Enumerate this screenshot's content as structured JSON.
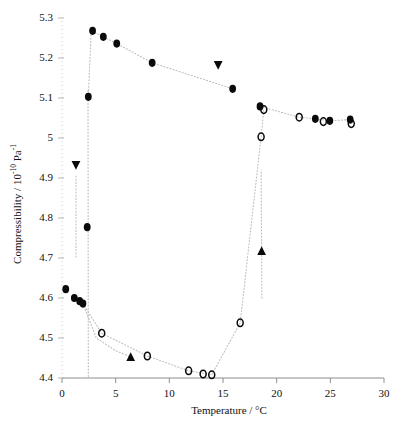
{
  "chart_data": {
    "type": "scatter",
    "title": "",
    "xlabel": "Temperature / °C",
    "ylabel": "Compressibility / 10⁻¹⁰ Pa⁻¹",
    "ylabel_parts": {
      "main": "Compressibility / 10",
      "exp1": "-10",
      "mid": " Pa",
      "exp2": "-1"
    },
    "xlim": [
      0,
      30
    ],
    "ylim": [
      4.4,
      5.3
    ],
    "xticks": [
      0,
      5,
      10,
      15,
      20,
      25,
      30
    ],
    "xtick_labels": [
      "0",
      "5",
      "10",
      "15",
      "20",
      "25",
      "30"
    ],
    "yticks": [
      4.4,
      4.5,
      4.6,
      4.7,
      4.8,
      4.9,
      5.0,
      5.1,
      5.2,
      5.3
    ],
    "ytick_labels": [
      "4.4",
      "4.5",
      "4.6",
      "4.7",
      "4.8",
      "4.9",
      "5",
      "5.1",
      "5.2",
      "5.3"
    ],
    "grid": false,
    "legend": "none",
    "marker_colors": {
      "filled": "#0a0a0a",
      "open": "#0a0a0a",
      "line": "#b9b9b9"
    },
    "series": [
      {
        "name": "filled-circles-branch",
        "marker": "filled-circle",
        "points": [
          {
            "x": 0.35,
            "y": 4.622
          },
          {
            "x": 1.15,
            "y": 4.6
          },
          {
            "x": 1.65,
            "y": 4.592
          },
          {
            "x": 1.95,
            "y": 4.586
          },
          {
            "x": 2.35,
            "y": 4.777
          },
          {
            "x": 2.45,
            "y": 5.103
          },
          {
            "x": 2.85,
            "y": 5.268
          },
          {
            "x": 3.85,
            "y": 5.253
          },
          {
            "x": 5.1,
            "y": 5.236
          },
          {
            "x": 8.4,
            "y": 5.188
          },
          {
            "x": 15.9,
            "y": 5.123
          },
          {
            "x": 18.45,
            "y": 5.079
          },
          {
            "x": 23.6,
            "y": 5.048
          },
          {
            "x": 24.95,
            "y": 5.043
          },
          {
            "x": 26.85,
            "y": 5.046
          }
        ]
      },
      {
        "name": "open-circles-branch",
        "marker": "open-circle",
        "points": [
          {
            "x": 3.7,
            "y": 4.512
          },
          {
            "x": 7.95,
            "y": 4.455
          },
          {
            "x": 11.8,
            "y": 4.418
          },
          {
            "x": 13.15,
            "y": 4.41
          },
          {
            "x": 13.95,
            "y": 4.408
          },
          {
            "x": 16.6,
            "y": 4.538
          },
          {
            "x": 18.55,
            "y": 5.003
          },
          {
            "x": 18.8,
            "y": 5.071
          },
          {
            "x": 22.1,
            "y": 5.052
          },
          {
            "x": 24.35,
            "y": 5.041
          },
          {
            "x": 26.95,
            "y": 5.036
          }
        ]
      },
      {
        "name": "down-triangles",
        "marker": "down-triangle",
        "points": [
          {
            "x": 1.3,
            "y": 4.932
          },
          {
            "x": 14.55,
            "y": 5.182
          }
        ]
      },
      {
        "name": "up-triangles",
        "marker": "up-triangle",
        "points": [
          {
            "x": 6.4,
            "y": 4.453
          },
          {
            "x": 18.6,
            "y": 4.718
          }
        ]
      }
    ],
    "connector_paths": [
      {
        "name": "upper-filled-trace",
        "points": [
          {
            "x": 2.45,
            "y": 5.103
          },
          {
            "x": 2.72,
            "y": 5.268
          },
          {
            "x": 3.85,
            "y": 5.253
          },
          {
            "x": 5.1,
            "y": 5.236
          },
          {
            "x": 8.4,
            "y": 5.188
          },
          {
            "x": 15.9,
            "y": 5.123
          }
        ]
      },
      {
        "name": "right-plateau-trace",
        "points": [
          {
            "x": 18.45,
            "y": 5.079
          },
          {
            "x": 22.1,
            "y": 5.052
          },
          {
            "x": 23.6,
            "y": 5.048
          },
          {
            "x": 24.95,
            "y": 5.043
          },
          {
            "x": 26.85,
            "y": 5.046
          }
        ]
      },
      {
        "name": "lower-open-trace",
        "points": [
          {
            "x": 1.95,
            "y": 4.586
          },
          {
            "x": 3.7,
            "y": 4.512
          },
          {
            "x": 7.95,
            "y": 4.455
          },
          {
            "x": 11.8,
            "y": 4.418
          },
          {
            "x": 13.95,
            "y": 4.408
          },
          {
            "x": 16.6,
            "y": 4.538
          },
          {
            "x": 18.55,
            "y": 5.003
          },
          {
            "x": 18.8,
            "y": 5.071
          }
        ]
      },
      {
        "name": "lower-filled-tail",
        "points": [
          {
            "x": 1.95,
            "y": 4.586
          },
          {
            "x": 3.2,
            "y": 4.5
          },
          {
            "x": 5.0,
            "y": 4.468
          },
          {
            "x": 6.4,
            "y": 4.453
          }
        ]
      },
      {
        "name": "vertical-riser",
        "points": [
          {
            "x": 2.45,
            "y": 4.404
          },
          {
            "x": 2.42,
            "y": 5.12
          }
        ]
      },
      {
        "name": "triangle-riser",
        "points": [
          {
            "x": 18.62,
            "y": 4.6
          },
          {
            "x": 18.55,
            "y": 4.92
          }
        ]
      },
      {
        "name": "triangle-down-stem",
        "points": [
          {
            "x": 1.3,
            "y": 4.905
          },
          {
            "x": 1.3,
            "y": 4.7
          }
        ]
      }
    ]
  }
}
